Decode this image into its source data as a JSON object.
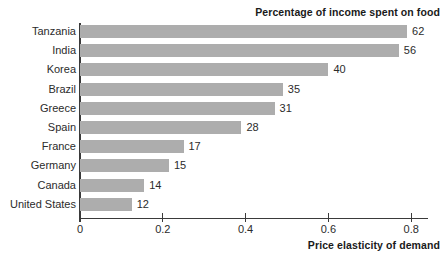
{
  "chart_data": {
    "type": "bar",
    "orientation": "horizontal",
    "title": "Percentage of income spent on food",
    "xlabel": "Price elasticity of demand",
    "ylabel": "",
    "grid": false,
    "legend": null,
    "xlim": [
      0,
      0.84
    ],
    "xticks": [
      "0",
      "0.2",
      "0.4",
      "0.6",
      "0.8"
    ],
    "xtick_values": [
      0,
      0.2,
      0.4,
      0.6,
      0.8
    ],
    "categories": [
      "Tanzania",
      "India",
      "Korea",
      "Brazil",
      "Greece",
      "Spain",
      "France",
      "Germany",
      "Canada",
      "United States"
    ],
    "values": [
      0.79,
      0.77,
      0.6,
      0.49,
      0.47,
      0.39,
      0.25,
      0.215,
      0.155,
      0.125
    ],
    "data_labels": [
      "62",
      "56",
      "40",
      "35",
      "31",
      "28",
      "17",
      "15",
      "14",
      "12"
    ],
    "data_label_meaning": "Percentage of income spent on food",
    "bar_color": "#adadad",
    "axis_color": "#3a3a3a",
    "text_color": "#2b2b2b"
  }
}
